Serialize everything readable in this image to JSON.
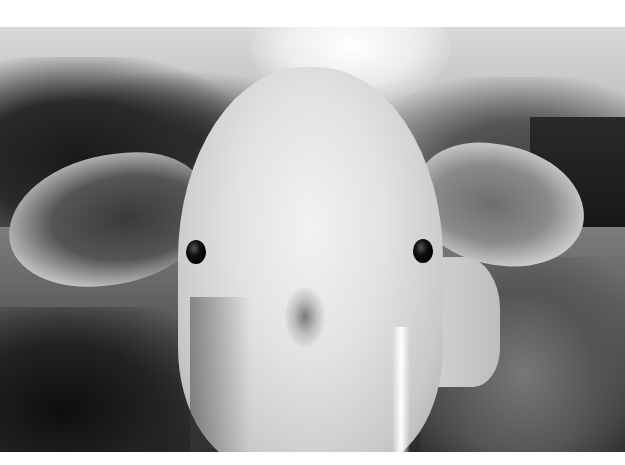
{
  "image": {
    "description": "Black-and-white close-up photograph of a white cow's face looking at the camera, large fuzzy ears spread to each side, blurred trees and pasture in the background",
    "palette": {
      "background": "#ffffff",
      "fur_light": "#f2f2f2",
      "fur_mid": "#c9c9c9",
      "eyes": "#000000",
      "trees_dark": "#1a1a1a",
      "field": "#5c5c5c",
      "sky": "#d9d9d9"
    },
    "subjects": [
      "cow-head",
      "left-ear",
      "right-ear",
      "left-eye",
      "right-eye",
      "forehead-whorl",
      "background-trees",
      "pasture"
    ]
  }
}
